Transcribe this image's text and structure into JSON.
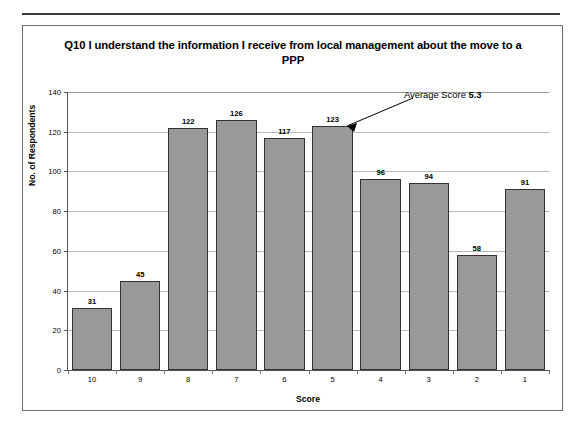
{
  "chart_data": {
    "type": "bar",
    "title": "Q10 I understand the information I receive from local management about the move to a PPP",
    "xlabel": "Score",
    "ylabel": "No. of Respondents",
    "categories": [
      "10",
      "9",
      "8",
      "7",
      "6",
      "5",
      "4",
      "3",
      "2",
      "1"
    ],
    "values": [
      31,
      45,
      122,
      126,
      117,
      123,
      96,
      94,
      58,
      91
    ],
    "ylim": [
      0,
      140
    ],
    "yticks": [
      0,
      20,
      40,
      60,
      80,
      100,
      120,
      140
    ],
    "ytick_labels": [
      "0",
      "20",
      "40",
      "60",
      "80",
      "100",
      "120",
      "140"
    ],
    "grid": true,
    "legend": false,
    "bar_color": "#999999",
    "bar_border_color": "#333333",
    "annotations": [
      {
        "label": "Average Score",
        "value": "5.3",
        "points_to_category": "5"
      }
    ]
  }
}
